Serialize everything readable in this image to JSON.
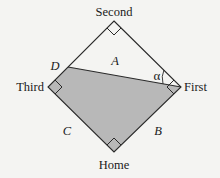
{
  "diagram": {
    "type": "baseball-diamond",
    "bases": {
      "second": {
        "label": "Second",
        "x": 114,
        "y": 21
      },
      "first": {
        "label": "First",
        "x": 181,
        "y": 87
      },
      "home": {
        "label": "Home",
        "x": 114,
        "y": 152
      },
      "third": {
        "label": "Third",
        "x": 48,
        "y": 87
      }
    },
    "point_d": {
      "label": "D",
      "x": 68,
      "y": 67
    },
    "region_labels": {
      "a": "A",
      "b": "B",
      "c": "C"
    },
    "angle_label": "α",
    "colors": {
      "background": "#f4f4f2",
      "line": "#2a2a2a",
      "shaded_region": "#b8b8b8",
      "text": "#1a1a1a"
    }
  }
}
